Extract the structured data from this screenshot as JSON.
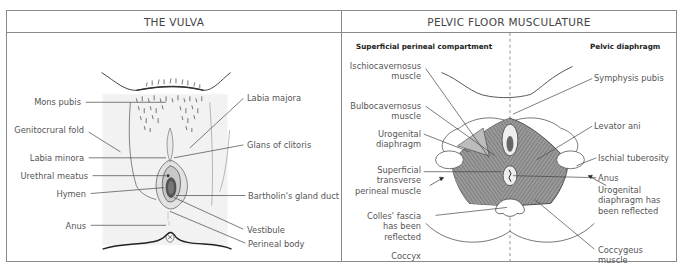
{
  "panels": {
    "vulva": {
      "title": "THE VULVA",
      "labels_left": {
        "mons_pubis": "Mons pubis",
        "genitocrural_fold": "Genitocrural fold",
        "labia_minora": "Labia minora",
        "urethral_meatus": "Urethral meatus",
        "hymen": "Hymen",
        "anus": "Anus"
      },
      "labels_right": {
        "labia_majora": "Labia majora",
        "glans_of_clitoris": "Glans of clitoris",
        "bartholins_gland_duct": "Bartholin's gland duct",
        "vestibule": "Vestibule",
        "perineal_body": "Perineal body"
      }
    },
    "pelvic_floor": {
      "title": "PELVIC FLOOR MUSCULATURE",
      "subheadings": {
        "left": "Superficial perineal compartment",
        "right": "Pelvic diaphragm"
      },
      "labels_left": {
        "ischiocavernosus_1": "Ischiocavernosus",
        "ischiocavernosus_2": "muscle",
        "bulbocavernosus_1": "Bulbocavernosus",
        "bulbocavernosus_2": "muscle",
        "urogenital_1": "Urogenital",
        "urogenital_2": "diaphragm",
        "superficial_1": "Superficial",
        "superficial_2": "transverse",
        "superficial_3": "perineal muscle",
        "colles_1": "Colles' fascia",
        "colles_2": "has been",
        "colles_3": "reflected",
        "coccyx": "Coccyx"
      },
      "labels_right": {
        "symphysis_pubis": "Symphysis pubis",
        "levator_ani": "Levator ani",
        "ischial_tuberosity": "Ischial tuberosity",
        "anus": "Anus",
        "urogenital_reflected_1": "Urogenital",
        "urogenital_reflected_2": "diaphragm has",
        "urogenital_reflected_3": "been reflected",
        "coccygeus_1": "Coccygeus",
        "coccygeus_2": "muscle"
      }
    }
  },
  "colors": {
    "border": "#8a8a8a",
    "muscle_fill": "#8c8c8c",
    "skin_shade": "#eeeeee",
    "leader_line": "#444444"
  }
}
